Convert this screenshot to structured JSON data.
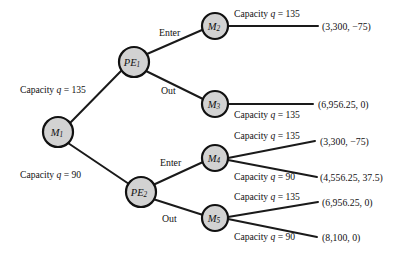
{
  "diagram": {
    "colors": {
      "node_fill": "#d2d2d2",
      "node_stroke": "#111111",
      "edge": "#1a1a1a",
      "text": "#111111",
      "background": "#ffffff"
    },
    "nodes": [
      {
        "id": "M1",
        "letter": "M",
        "sub": "1",
        "cx": 58,
        "cy": 132,
        "r": 15
      },
      {
        "id": "PE1",
        "letter": "PE",
        "sub": "1",
        "cx": 134,
        "cy": 62,
        "r": 15
      },
      {
        "id": "PE2",
        "letter": "PE",
        "sub": "2",
        "cx": 141,
        "cy": 192,
        "r": 15
      },
      {
        "id": "M2",
        "letter": "M",
        "sub": "2",
        "cx": 215,
        "cy": 26,
        "r": 13
      },
      {
        "id": "M3",
        "letter": "M",
        "sub": "3",
        "cx": 215,
        "cy": 104,
        "r": 13
      },
      {
        "id": "M4",
        "letter": "M",
        "sub": "4",
        "cx": 215,
        "cy": 158,
        "r": 13
      },
      {
        "id": "M5",
        "letter": "M",
        "sub": "5",
        "cx": 215,
        "cy": 218,
        "r": 13
      }
    ],
    "edges": [
      {
        "id": "e-m1-pe1",
        "from": "M1",
        "to": "PE1",
        "x1": 70,
        "y1": 123,
        "x2": 122,
        "y2": 70
      },
      {
        "id": "e-m1-pe2",
        "from": "M1",
        "to": "PE2",
        "x1": 68,
        "y1": 143,
        "x2": 129,
        "y2": 184
      },
      {
        "id": "e-pe1-m2",
        "from": "PE1",
        "to": "M2",
        "x1": 147,
        "y1": 54,
        "x2": 202,
        "y2": 30
      },
      {
        "id": "e-pe1-m3",
        "from": "PE1",
        "to": "M3",
        "x1": 146,
        "y1": 71,
        "x2": 203,
        "y2": 99
      },
      {
        "id": "e-pe2-m4",
        "from": "PE2",
        "to": "M4",
        "x1": 153,
        "y1": 185,
        "x2": 203,
        "y2": 162
      },
      {
        "id": "e-pe2-m5",
        "from": "PE2",
        "to": "M5",
        "x1": 153,
        "y1": 199,
        "x2": 203,
        "y2": 215
      },
      {
        "id": "e-m2-p1",
        "from": "M2",
        "to": "P1",
        "x1": 229,
        "y1": 26,
        "x2": 318,
        "y2": 26
      },
      {
        "id": "e-m3-p2",
        "from": "M3",
        "to": "P2",
        "x1": 229,
        "y1": 104,
        "x2": 313,
        "y2": 104
      },
      {
        "id": "e-m4-p3",
        "from": "M4",
        "to": "P3",
        "x1": 228,
        "y1": 158,
        "x2": 315,
        "y2": 141
      },
      {
        "id": "e-m4-p4",
        "from": "M4",
        "to": "P4",
        "x1": 228,
        "y1": 160,
        "x2": 317,
        "y2": 177
      },
      {
        "id": "e-m5-p5",
        "from": "M5",
        "to": "P5",
        "x1": 228,
        "y1": 217,
        "x2": 318,
        "y2": 202
      },
      {
        "id": "e-m5-p6",
        "from": "M5",
        "to": "P6",
        "x1": 228,
        "y1": 219,
        "x2": 317,
        "y2": 237
      }
    ],
    "capacity_labels": [
      {
        "id": "cap-m1-pe1",
        "prefix": "Capacity ",
        "var": "q",
        "eq": " = ",
        "value": "135",
        "x": 20,
        "y": 93,
        "anchor": "start"
      },
      {
        "id": "cap-m1-pe2",
        "prefix": "Capacity ",
        "var": "q",
        "eq": " = ",
        "value": "90",
        "x": 20,
        "y": 178,
        "anchor": "start"
      },
      {
        "id": "cap-m2",
        "prefix": "Capacity ",
        "var": "q",
        "eq": " = ",
        "value": "135",
        "x": 234,
        "y": 17,
        "anchor": "start"
      },
      {
        "id": "cap-m3",
        "prefix": "Capacity ",
        "var": "q",
        "eq": " = ",
        "value": "135",
        "x": 234,
        "y": 118,
        "anchor": "start"
      },
      {
        "id": "cap-m4-hi",
        "prefix": "Capacity ",
        "var": "q",
        "eq": " = ",
        "value": "135",
        "x": 234,
        "y": 139,
        "anchor": "start"
      },
      {
        "id": "cap-m4-lo",
        "prefix": "Capacity ",
        "var": "q",
        "eq": " = ",
        "value": "90",
        "x": 234,
        "y": 180,
        "anchor": "start"
      },
      {
        "id": "cap-m5-hi",
        "prefix": "Capacity ",
        "var": "q",
        "eq": " = ",
        "value": "135",
        "x": 234,
        "y": 200,
        "anchor": "start"
      },
      {
        "id": "cap-m5-lo",
        "prefix": "Capacity ",
        "var": "q",
        "eq": " = ",
        "value": "90",
        "x": 234,
        "y": 240,
        "anchor": "start"
      }
    ],
    "action_labels": [
      {
        "id": "action-pe1-enter",
        "text": "Enter",
        "x": 159,
        "y": 36
      },
      {
        "id": "action-pe1-out",
        "text": "Out",
        "x": 161,
        "y": 94
      },
      {
        "id": "action-pe2-enter",
        "text": "Enter",
        "x": 160,
        "y": 166
      },
      {
        "id": "action-pe2-out",
        "text": "Out",
        "x": 162,
        "y": 222
      }
    ],
    "payoffs": [
      {
        "id": "payoff-1",
        "text": "(3,300,  −75)",
        "x": 322,
        "y": 30
      },
      {
        "id": "payoff-2",
        "text": "(6,956.25, 0)",
        "x": 318,
        "y": 108
      },
      {
        "id": "payoff-3",
        "text": "(3,300,  −75)",
        "x": 320,
        "y": 145
      },
      {
        "id": "payoff-4",
        "text": "(4,556.25, 37.5)",
        "x": 320,
        "y": 181
      },
      {
        "id": "payoff-5",
        "text": "(6,956.25, 0)",
        "x": 322,
        "y": 206
      },
      {
        "id": "payoff-6",
        "text": "(8,100, 0)",
        "x": 322,
        "y": 241
      }
    ]
  }
}
